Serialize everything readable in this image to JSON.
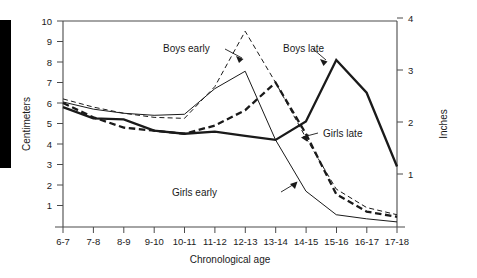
{
  "chart_data": {
    "type": "line",
    "title": "",
    "xlabel": "Chronological age",
    "ylabel": "Centimeters",
    "y2label": "Inches",
    "categories": [
      "6-7",
      "7-8",
      "8-9",
      "9-10",
      "10-11",
      "11-12",
      "12-13",
      "13-14",
      "14-15",
      "15-16",
      "16-17",
      "17-18"
    ],
    "ylim": [
      0,
      10
    ],
    "yticks": [
      1,
      2,
      3,
      4,
      5,
      6,
      7,
      8,
      9,
      10
    ],
    "y2lim": [
      0,
      3.94
    ],
    "y2ticks": [
      1,
      2,
      3,
      4
    ],
    "grid": false,
    "legend_position": "inline-annotations",
    "series": [
      {
        "name": "Boys early",
        "style": "thin-dashed",
        "values": [
          6.2,
          5.8,
          5.5,
          5.3,
          5.25,
          6.8,
          9.5,
          7.0,
          4.3,
          1.8,
          0.9,
          0.55
        ]
      },
      {
        "name": "Boys late",
        "style": "thick-solid",
        "values": [
          5.8,
          5.25,
          5.2,
          4.65,
          4.5,
          4.6,
          4.4,
          4.2,
          5.1,
          8.1,
          6.5,
          2.9
        ]
      },
      {
        "name": "Girls early",
        "style": "thin-solid",
        "values": [
          6.05,
          5.7,
          5.5,
          5.4,
          5.45,
          6.7,
          7.55,
          4.2,
          1.7,
          0.55,
          0.35,
          0.2
        ]
      },
      {
        "name": "Girls late",
        "style": "thick-dashed",
        "values": [
          6.0,
          5.3,
          4.8,
          4.65,
          4.5,
          4.9,
          5.65,
          7.0,
          4.5,
          1.55,
          0.7,
          0.45
        ]
      }
    ],
    "annotations": [
      {
        "text": "Boys early",
        "target_series": "Boys early",
        "target_category": "12-13"
      },
      {
        "text": "Boys late",
        "target_series": "Boys late",
        "target_category": "15-16"
      },
      {
        "text": "Girls late",
        "target_series": "Girls late",
        "target_category": "14-15"
      },
      {
        "text": "Girls early",
        "target_series": "Girls early",
        "target_category": "13-14"
      }
    ]
  },
  "axes": {
    "left_title": "Centimeters",
    "right_title": "Inches",
    "bottom_title": "Chronological age",
    "left_ticks": [
      "10",
      "9",
      "8",
      "7",
      "6",
      "5",
      "4",
      "3",
      "2",
      "1"
    ],
    "right_ticks": [
      "4",
      "3",
      "2",
      "1"
    ],
    "x_ticks": [
      "6-7",
      "7-8",
      "8-9",
      "9-10",
      "10-11",
      "11-12",
      "12-13",
      "13-14",
      "14-15",
      "15-16",
      "16-17",
      "17-18"
    ]
  },
  "annotations": {
    "boys_early": "Boys early",
    "boys_late": "Boys late",
    "girls_late": "Girls late",
    "girls_early": "Girls early"
  },
  "colors": {
    "line": "#1a1a1a",
    "axis": "#4a4a4a",
    "background": "#ffffff",
    "bar": "#000000"
  }
}
